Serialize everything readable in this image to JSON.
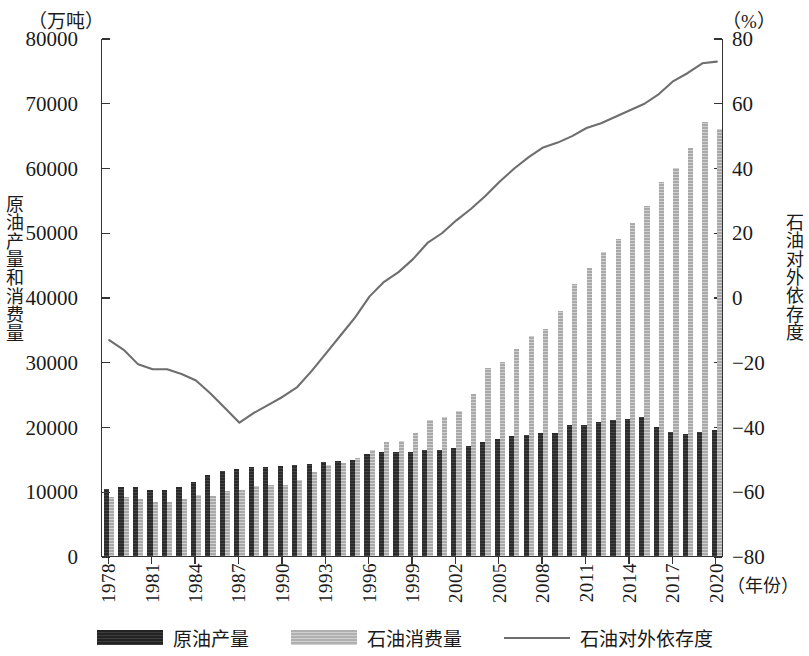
{
  "figure": {
    "unit_left": "（万吨）",
    "unit_right": "（%）",
    "axis_title_left": "原油产量和消费量",
    "axis_title_right": "石油对外依存度",
    "x_unit": "（年份）"
  },
  "legend": {
    "items": [
      {
        "label": "原油产量",
        "swatch": "prod",
        "color": "#232323"
      },
      {
        "label": "石油消费量",
        "swatch": "cons",
        "color": "#b0b0b0"
      },
      {
        "label": "石油对外依存度",
        "swatch": "line",
        "color": "#6e6e6e"
      }
    ]
  },
  "chart_data": {
    "type": "bar",
    "title": "",
    "xlabel": "（年份）",
    "ylabel": "原油产量和消费量",
    "y2label": "石油对外依存度",
    "yunit": "万吨",
    "y2unit": "%",
    "ylim": [
      0,
      80000
    ],
    "y2lim": [
      -80,
      80
    ],
    "yticks": [
      0,
      10000,
      20000,
      30000,
      40000,
      50000,
      60000,
      70000,
      80000
    ],
    "y2ticks": [
      -80,
      -60,
      -40,
      -20,
      0,
      20,
      40,
      60,
      80
    ],
    "grid": false,
    "legend_position": "bottom",
    "x": [
      1978,
      1979,
      1980,
      1981,
      1982,
      1983,
      1984,
      1985,
      1986,
      1987,
      1988,
      1989,
      1990,
      1991,
      1992,
      1993,
      1994,
      1995,
      1996,
      1997,
      1998,
      1999,
      2000,
      2001,
      2002,
      2003,
      2004,
      2005,
      2006,
      2007,
      2008,
      2009,
      2010,
      2011,
      2012,
      2013,
      2014,
      2015,
      2016,
      2017,
      2018,
      2019,
      2020
    ],
    "xticklabels": [
      "1978",
      "1981",
      "1984",
      "1987",
      "1990",
      "1993",
      "1996",
      "1999",
      "2002",
      "2005",
      "2008",
      "2011",
      "2014",
      "2017",
      "2020"
    ],
    "xtick_step": 3,
    "series": [
      {
        "name": "原油产量",
        "axis": "left",
        "color": "#2b2b2b",
        "values": [
          10405,
          10615,
          10595,
          10122,
          10212,
          10607,
          11461,
          12490,
          13069,
          13414,
          13705,
          13764,
          13831,
          14099,
          14210,
          14524,
          14608,
          14900,
          15733,
          16074,
          16100,
          16000,
          16300,
          16396,
          16700,
          16960,
          17587,
          18135,
          18477,
          18632,
          19044,
          18949,
          20301,
          20288,
          20748,
          20992,
          21143,
          21456,
          19969,
          19151,
          18911,
          19101,
          19477
        ]
      },
      {
        "name": "石油消费量",
        "axis": "left",
        "color": "#a9a9a9",
        "values": [
          9130,
          9100,
          8800,
          8400,
          8400,
          8800,
          9400,
          9200,
          10000,
          10200,
          10800,
          11000,
          11000,
          11800,
          13000,
          14000,
          14300,
          15100,
          16300,
          17600,
          17800,
          19000,
          21000,
          21500,
          22400,
          25000,
          29000,
          30000,
          32000,
          34000,
          35000,
          37800,
          42000,
          44500,
          47000,
          49000,
          51500,
          54000,
          57800,
          60000,
          63000,
          67000,
          66000
        ]
      },
      {
        "name": "石油对外依存度",
        "axis": "right",
        "color": "#6e6e6e",
        "values": [
          -13.0,
          -16.0,
          -20.5,
          -22.0,
          -22.0,
          -23.5,
          -25.5,
          -29.5,
          -34.0,
          -38.5,
          -35.5,
          -33.0,
          -30.5,
          -27.5,
          -22.5,
          -17.0,
          -11.5,
          -6.0,
          0.5,
          5.0,
          8.0,
          12.0,
          17.0,
          20.0,
          24.0,
          27.5,
          31.5,
          36.0,
          40.0,
          43.5,
          46.5,
          48.0,
          50.0,
          52.5,
          54.0,
          56.0,
          58.0,
          60.0,
          63.0,
          67.0,
          69.5,
          72.5,
          73.0
        ]
      }
    ]
  }
}
